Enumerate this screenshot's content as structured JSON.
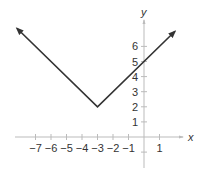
{
  "chart_data": {
    "type": "line",
    "title": "",
    "xlabel": "x",
    "ylabel": "y",
    "xlim": [
      -8,
      2
    ],
    "ylim": [
      -1,
      7.5
    ],
    "grid": false,
    "legend": null,
    "x_ticks": [
      -7,
      -6,
      -5,
      -4,
      -3,
      -2,
      -1,
      1
    ],
    "y_ticks": [
      1,
      2,
      3,
      4,
      5,
      6
    ],
    "series": [
      {
        "name": "y = |x + 3| + 2",
        "x": [
          -8.2,
          -3,
          2.0
        ],
        "y": [
          7.2,
          2,
          7.0
        ],
        "arrows": "both-ends",
        "vertex": [
          -3,
          2
        ],
        "y_intercept": 5
      }
    ]
  },
  "axes": {
    "x_label": "x",
    "y_label": "y",
    "x_tick_labels": [
      "−7",
      "−6",
      "−5",
      "−4",
      "−3",
      "−2",
      "−1",
      "1"
    ],
    "y_tick_labels": [
      "1",
      "2",
      "3",
      "4",
      "5",
      "6"
    ]
  },
  "colors": {
    "curve": "#333333",
    "axis": "#bbbbbb",
    "text": "#333333"
  }
}
